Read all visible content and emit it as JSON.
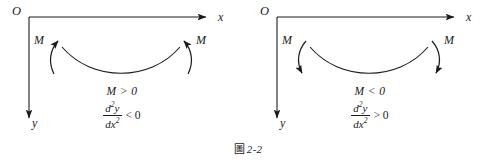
{
  "figure": {
    "caption_label": "圖",
    "caption_number": "2-2",
    "line_color": "#1a1a1a",
    "background_color": "#ffffff"
  },
  "panels": [
    {
      "id": "positive-moment",
      "origin_label": "O",
      "x_axis_label": "x",
      "y_axis_label": "y",
      "moment_label_left": "M",
      "moment_label_right": "M",
      "arrow_direction": "up",
      "curve_shape": "sagging",
      "condition": "M > 0",
      "derivative": {
        "numerator": "d",
        "numerator_sup": "2",
        "numerator_var": "y",
        "denominator": "dx",
        "denominator_sup": "2",
        "relation": "< 0"
      }
    },
    {
      "id": "negative-moment",
      "origin_label": "O",
      "x_axis_label": "x",
      "y_axis_label": "y",
      "moment_label_left": "M",
      "moment_label_right": "M",
      "arrow_direction": "down",
      "curve_shape": "sagging",
      "condition": "M < 0",
      "derivative": {
        "numerator": "d",
        "numerator_sup": "2",
        "numerator_var": "y",
        "denominator": "dx",
        "denominator_sup": "2",
        "relation": "> 0"
      }
    }
  ]
}
